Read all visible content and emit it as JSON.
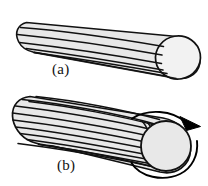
{
  "figure": {
    "background_color": "#ffffff",
    "width": 208,
    "height": 186,
    "panels": [
      {
        "id": "a",
        "label": "(a)",
        "label_x": 52,
        "label_y": 62,
        "description": "Untwisted cylindrical fiber bundle with straight longitudinal lines and a circular end cap at the right",
        "body_fill": "#e8e8e8",
        "endcap_fill": "#f2f2f2",
        "outline_color": "#111111",
        "stripe_color": "#111111",
        "stripe_count": 5,
        "stripe_type": "straight",
        "endcap": {
          "cx": 178,
          "cy": 52,
          "rx": 22,
          "ry": 23
        },
        "axis": {
          "x1": 26,
          "y1": 26,
          "x2": 178,
          "y2": 52
        },
        "has_rotation_arrow": false
      },
      {
        "id": "b",
        "label": "(b)",
        "label_x": 57,
        "label_y": 158,
        "description": "Twisted fiber bundle with many helical stripes converging toward the right end cap, annotated with a clockwise rotation arrow",
        "body_fill": "#e8e8e8",
        "endcap_fill": "#e8e8e8",
        "outline_color": "#111111",
        "stripe_color": "#111111",
        "stripe_count": 12,
        "stripe_type": "helical",
        "endcap": {
          "cx": 166,
          "cy": 145,
          "rx": 25,
          "ry": 26
        },
        "axis": {
          "x1": 26,
          "y1": 118,
          "x2": 166,
          "y2": 145
        },
        "has_rotation_arrow": true,
        "rotation_arrow": {
          "name": "rotation-arrow",
          "direction": "clockwise",
          "color": "#000000",
          "sweep_degrees": 300,
          "radius": 38,
          "center_x": 163,
          "center_y": 146,
          "arrowhead": "filled-triangle"
        }
      }
    ]
  },
  "colors": {
    "body_gray": "#e8e8e8",
    "endcap_light": "#f2f2f2",
    "outline": "#111111",
    "arrow": "#000000",
    "background": "#ffffff"
  }
}
